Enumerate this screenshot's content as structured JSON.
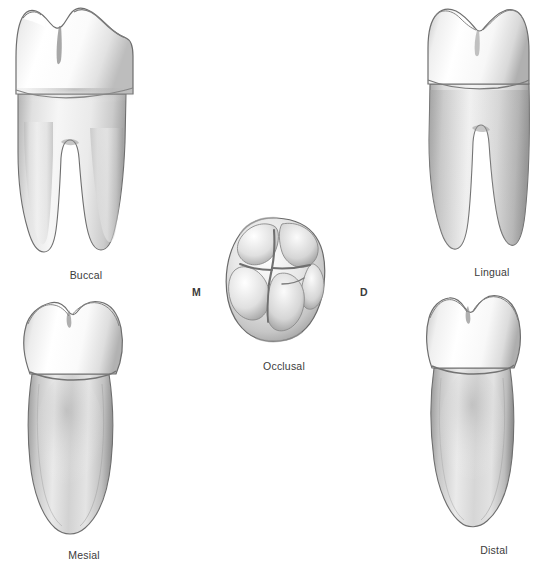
{
  "figure": {
    "background_color": "#ffffff",
    "ink_color": "#3b3b3b",
    "enamel_color": "#f2f2f2",
    "dentin_color": "#d8d8d8",
    "outline_color": "#6e6e6e"
  },
  "views": [
    {
      "id": "buccal",
      "label": "Buccal"
    },
    {
      "id": "lingual",
      "label": "Lingual"
    },
    {
      "id": "occlusal",
      "label": "Occlusal"
    },
    {
      "id": "mesial",
      "label": "Mesial"
    },
    {
      "id": "distal",
      "label": "Distal"
    }
  ],
  "occlusal_axis": {
    "mesial_marker": "M",
    "distal_marker": "D"
  }
}
